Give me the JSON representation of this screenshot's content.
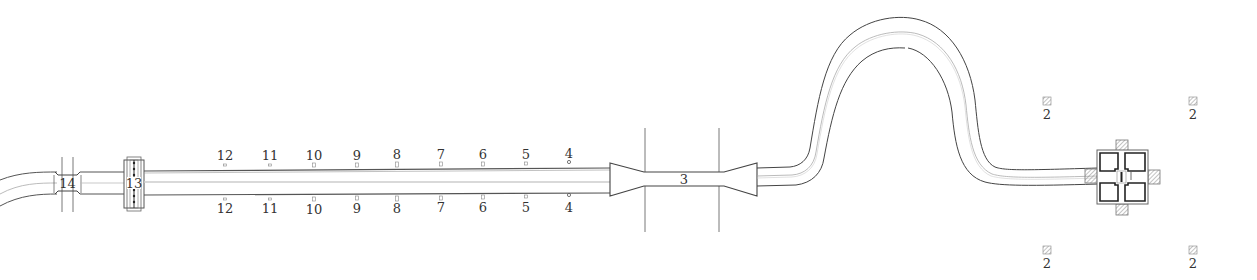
{
  "diagram": {
    "title": "",
    "type": "site-plan",
    "colors": {
      "line_dark": "#444444",
      "line_light": "#aaaaaa",
      "background": "#ffffff",
      "hatch": "#888888"
    },
    "road_labels": {
      "gate_14": "14",
      "gate_13": "13",
      "gate_3": "3"
    },
    "markers_top": [
      {
        "label": "12",
        "x": 225
      },
      {
        "label": "11",
        "x": 270
      },
      {
        "label": "10",
        "x": 314
      },
      {
        "label": "9",
        "x": 357
      },
      {
        "label": "8",
        "x": 397
      },
      {
        "label": "7",
        "x": 441
      },
      {
        "label": "6",
        "x": 483
      },
      {
        "label": "5",
        "x": 526
      },
      {
        "label": "4",
        "x": 569
      }
    ],
    "markers_bottom": [
      {
        "label": "12",
        "x": 225
      },
      {
        "label": "11",
        "x": 270
      },
      {
        "label": "10",
        "x": 314
      },
      {
        "label": "9",
        "x": 357
      },
      {
        "label": "8",
        "x": 397
      },
      {
        "label": "7",
        "x": 441
      },
      {
        "label": "6",
        "x": 483
      },
      {
        "label": "5",
        "x": 526
      },
      {
        "label": "4",
        "x": 569
      }
    ],
    "corner_markers": [
      {
        "label": "2",
        "x": 1047,
        "y": 104
      },
      {
        "label": "2",
        "x": 1193,
        "y": 104
      },
      {
        "label": "2",
        "x": 1047,
        "y": 252
      },
      {
        "label": "2",
        "x": 1193,
        "y": 252
      }
    ]
  }
}
